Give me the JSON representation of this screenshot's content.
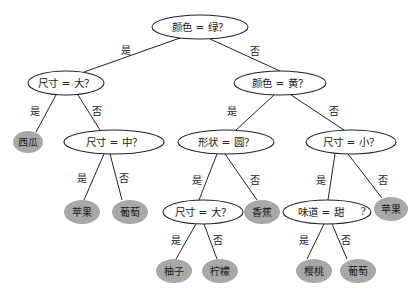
{
  "diagram": {
    "type": "decision-tree",
    "colors": {
      "edge": "#222222",
      "decision_fill": "#ffffff",
      "decision_stroke": "#222222",
      "leaf_fill": "#a8a8a8",
      "text": "#222222"
    },
    "nodes": [
      {
        "id": "n0",
        "kind": "decision",
        "label": "颜色 = 绿？",
        "cx": 200,
        "cy": 27,
        "rx": 48,
        "ry": 12
      },
      {
        "id": "n1",
        "kind": "decision",
        "label": "尺寸 = 大？",
        "cx": 66,
        "cy": 83,
        "rx": 38,
        "ry": 12
      },
      {
        "id": "n2",
        "kind": "decision",
        "label": "颜色 = 黄？",
        "cx": 280,
        "cy": 83,
        "rx": 46,
        "ry": 12
      },
      {
        "id": "n3",
        "kind": "leaf",
        "label": "西瓜",
        "cx": 28,
        "cy": 142,
        "rx": 15,
        "ry": 11
      },
      {
        "id": "n4",
        "kind": "decision",
        "label": "尺寸 = 中？",
        "cx": 114,
        "cy": 142,
        "rx": 50,
        "ry": 12
      },
      {
        "id": "n5",
        "kind": "decision",
        "label": "形状 = 圆？",
        "cx": 226,
        "cy": 142,
        "rx": 48,
        "ry": 12
      },
      {
        "id": "n6",
        "kind": "decision",
        "label": "尺寸 = 小？",
        "cx": 351,
        "cy": 142,
        "rx": 45,
        "ry": 12
      },
      {
        "id": "n7",
        "kind": "leaf",
        "label": "苹果",
        "cx": 82,
        "cy": 212,
        "rx": 18,
        "ry": 12
      },
      {
        "id": "n8",
        "kind": "leaf",
        "label": "葡萄",
        "cx": 130,
        "cy": 212,
        "rx": 18,
        "ry": 12
      },
      {
        "id": "n9",
        "kind": "decision",
        "label": "尺寸 = 大？",
        "cx": 203,
        "cy": 212,
        "rx": 40,
        "ry": 12
      },
      {
        "id": "n10",
        "kind": "leaf",
        "label": "香蕉",
        "cx": 262,
        "cy": 212,
        "rx": 18,
        "ry": 12
      },
      {
        "id": "n11",
        "kind": "decision",
        "label": "味道 = 甜",
        "cx": 327,
        "cy": 212,
        "rx": 44,
        "ry": 12,
        "suffix": "?"
      },
      {
        "id": "n12",
        "kind": "leaf",
        "label": "苹果",
        "cx": 391,
        "cy": 209,
        "rx": 17,
        "ry": 12
      },
      {
        "id": "n13",
        "kind": "leaf",
        "label": "柚子",
        "cx": 174,
        "cy": 271,
        "rx": 18,
        "ry": 12
      },
      {
        "id": "n14",
        "kind": "leaf",
        "label": "柠檬",
        "cx": 220,
        "cy": 271,
        "rx": 18,
        "ry": 12
      },
      {
        "id": "n15",
        "kind": "leaf",
        "label": "樱桃",
        "cx": 314,
        "cy": 271,
        "rx": 18,
        "ry": 12
      },
      {
        "id": "n16",
        "kind": "leaf",
        "label": "葡萄",
        "cx": 358,
        "cy": 271,
        "rx": 18,
        "ry": 12
      }
    ],
    "edges": [
      {
        "from": "n0",
        "to": "n1",
        "label": "是",
        "x1": 180,
        "y1": 38,
        "x2": 84,
        "y2": 72,
        "lx": 126,
        "ly": 50
      },
      {
        "from": "n0",
        "to": "n2",
        "label": "否",
        "x1": 210,
        "y1": 39,
        "x2": 280,
        "y2": 71,
        "lx": 255,
        "ly": 51
      },
      {
        "from": "n1",
        "to": "n3",
        "label": "是",
        "x1": 56,
        "y1": 95,
        "x2": 36,
        "y2": 132,
        "lx": 35,
        "ly": 111
      },
      {
        "from": "n1",
        "to": "n4",
        "label": "否",
        "x1": 78,
        "y1": 95,
        "x2": 100,
        "y2": 130,
        "lx": 97,
        "ly": 111
      },
      {
        "from": "n2",
        "to": "n5",
        "label": "是",
        "x1": 274,
        "y1": 95,
        "x2": 236,
        "y2": 130,
        "lx": 232,
        "ly": 111
      },
      {
        "from": "n2",
        "to": "n6",
        "label": "否",
        "x1": 291,
        "y1": 95,
        "x2": 344,
        "y2": 130,
        "lx": 334,
        "ly": 111
      },
      {
        "from": "n4",
        "to": "n7",
        "label": "是",
        "x1": 104,
        "y1": 154,
        "x2": 84,
        "y2": 200,
        "lx": 82,
        "ly": 178
      },
      {
        "from": "n4",
        "to": "n8",
        "label": "否",
        "x1": 110,
        "y1": 154,
        "x2": 122,
        "y2": 200,
        "lx": 124,
        "ly": 178
      },
      {
        "from": "n5",
        "to": "n9",
        "label": "是",
        "x1": 217,
        "y1": 154,
        "x2": 199,
        "y2": 200,
        "lx": 197,
        "ly": 180
      },
      {
        "from": "n5",
        "to": "n10",
        "label": "否",
        "x1": 225,
        "y1": 154,
        "x2": 257,
        "y2": 200,
        "lx": 255,
        "ly": 180
      },
      {
        "from": "n6",
        "to": "n11",
        "label": "是",
        "x1": 335,
        "y1": 154,
        "x2": 328,
        "y2": 200,
        "lx": 321,
        "ly": 180
      },
      {
        "from": "n6",
        "to": "n12",
        "label": "否",
        "x1": 348,
        "y1": 154,
        "x2": 382,
        "y2": 198,
        "lx": 383,
        "ly": 180
      },
      {
        "from": "n9",
        "to": "n13",
        "label": "是",
        "x1": 196,
        "y1": 224,
        "x2": 176,
        "y2": 259,
        "lx": 176,
        "ly": 240
      },
      {
        "from": "n9",
        "to": "n14",
        "label": "否",
        "x1": 204,
        "y1": 224,
        "x2": 217,
        "y2": 259,
        "lx": 218,
        "ly": 240
      },
      {
        "from": "n11",
        "to": "n15",
        "label": "是",
        "x1": 324,
        "y1": 224,
        "x2": 307,
        "y2": 259,
        "lx": 304,
        "ly": 240
      },
      {
        "from": "n11",
        "to": "n16",
        "label": "否",
        "x1": 332,
        "y1": 224,
        "x2": 347,
        "y2": 259,
        "lx": 346,
        "ly": 240
      }
    ]
  }
}
